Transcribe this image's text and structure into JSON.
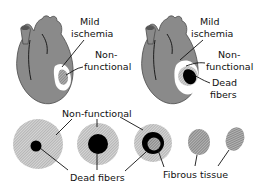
{
  "diagram": {
    "colors": {
      "heart": "#8a8a8a",
      "heart_outline": "#4a4a4a",
      "ischemia": "#ffffff",
      "nonfunctional": "#c2c2c2",
      "dead": "#000000",
      "fibrous": "#9a9a9a",
      "text": "#111111"
    },
    "hearts": [
      {
        "id": "heart-1",
        "labels": {
          "mild_ischemia": [
            "Mild",
            "ischemia"
          ],
          "nonfunctional": [
            "Non-",
            "functional"
          ]
        }
      },
      {
        "id": "heart-2",
        "labels": {
          "mild_ischemia": [
            "Mild",
            "ischemia"
          ],
          "nonfunctional": [
            "Non-",
            "functional"
          ],
          "dead": [
            "Dead",
            "fibers"
          ]
        }
      }
    ],
    "stages": {
      "nonfunctional_label": "Non-functional",
      "dead_fibers_label": "Dead fibers",
      "fibrous_tissue_label": "Fibrous tissue",
      "items": [
        {
          "stage": 1,
          "nonfunctional": true,
          "dead_core": "small",
          "fibrous_center": false
        },
        {
          "stage": 2,
          "nonfunctional": true,
          "dead_core": "large",
          "fibrous_center": false
        },
        {
          "stage": 3,
          "nonfunctional": true,
          "dead_core": "ring",
          "fibrous_center": true
        },
        {
          "stage": 4,
          "nonfunctional": false,
          "dead_core": "none",
          "fibrous_center": true
        },
        {
          "stage": 5,
          "nonfunctional": false,
          "dead_core": "none",
          "fibrous_center": true
        }
      ]
    }
  }
}
